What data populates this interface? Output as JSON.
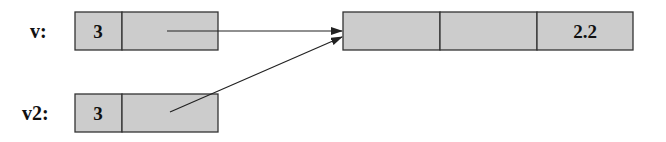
{
  "variables": [
    {
      "name": "v:",
      "size": "3"
    },
    {
      "name": "v2:",
      "size": "3"
    }
  ],
  "array": {
    "cells": [
      "",
      "",
      "2.2"
    ]
  }
}
